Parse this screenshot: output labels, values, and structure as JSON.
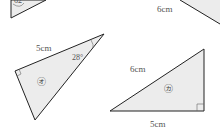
{
  "colors": {
    "stroke": "#222222",
    "fill": "#ececec",
    "text": "#555555"
  },
  "figures": {
    "partial_top_left": {
      "angle_label": "62°"
    },
    "partial_top_right": {
      "side_label": "6cm"
    },
    "triangle_o": {
      "name": "㋔",
      "side_label": "5cm",
      "angle_label": "28°",
      "right_angle": true
    },
    "triangle_ka": {
      "name": "㋕",
      "hypotenuse_label": "6cm",
      "base_label": "5cm",
      "right_angle": true
    }
  }
}
